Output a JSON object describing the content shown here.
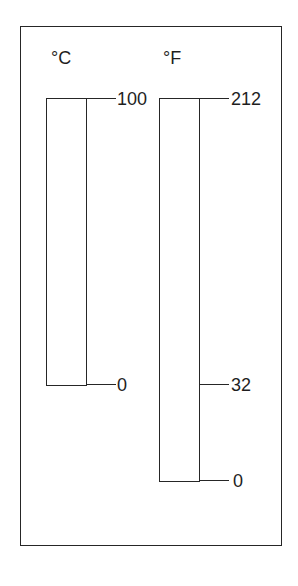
{
  "diagram": {
    "title": "",
    "scales": [
      {
        "id": "celsius",
        "unit_label": "°C",
        "tube": {
          "left": 46,
          "top": 98,
          "width": 41,
          "height": 288
        },
        "label_pos": {
          "left": 51,
          "top": 49
        },
        "ticks": [
          {
            "value": "100",
            "y": 99,
            "x1": 86,
            "x2": 116,
            "label_left": 117
          },
          {
            "value": "0",
            "y": 385,
            "x1": 86,
            "x2": 116,
            "label_left": 117
          }
        ]
      },
      {
        "id": "fahrenheit",
        "unit_label": "°F",
        "tube": {
          "left": 159,
          "top": 98,
          "width": 41,
          "height": 384
        },
        "label_pos": {
          "left": 163,
          "top": 49
        },
        "ticks": [
          {
            "value": "212",
            "y": 99,
            "x1": 199,
            "x2": 229,
            "label_left": 231
          },
          {
            "value": "32",
            "y": 385,
            "x1": 199,
            "x2": 229,
            "label_left": 231
          },
          {
            "value": "0",
            "y": 481,
            "x1": 199,
            "x2": 229,
            "label_left": 233
          }
        ]
      }
    ],
    "colors": {
      "line": "#262626",
      "text": "#1e1e1e",
      "background": "#ffffff"
    }
  }
}
